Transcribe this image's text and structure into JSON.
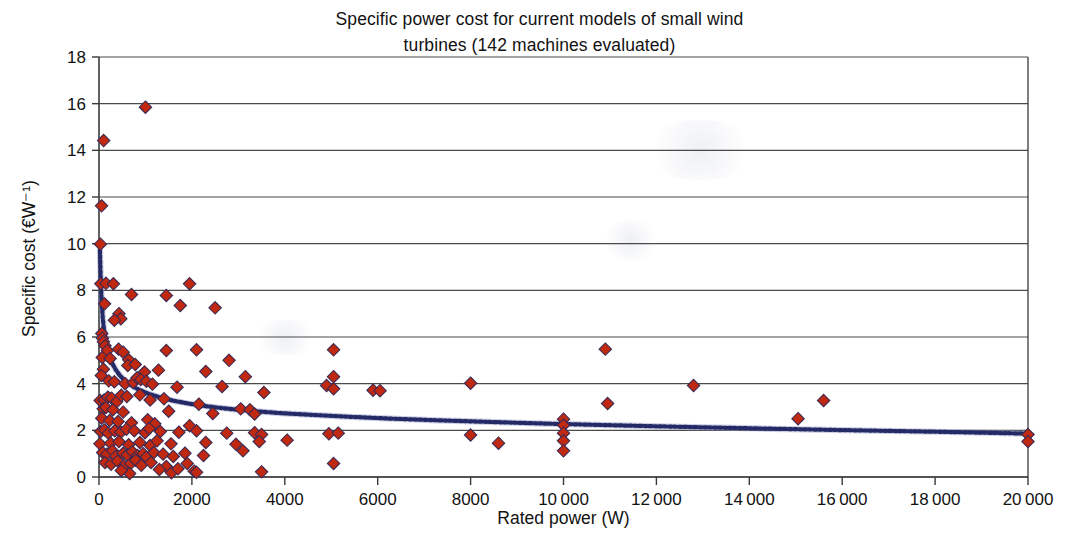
{
  "chart_data": {
    "type": "scatter",
    "title": "Specific power cost for current models of small wind\nturbines (142 machines evaluated)",
    "xlabel": "Rated power (W)",
    "ylabel": "Specific cost (€W⁻¹)",
    "xlim": [
      0,
      20000
    ],
    "ylim": [
      0,
      18
    ],
    "xticks": [
      0,
      2000,
      4000,
      6000,
      8000,
      10000,
      12000,
      14000,
      16000,
      18000,
      20000
    ],
    "xtick_labels": [
      "0",
      "2000",
      "4000",
      "6000",
      "8000",
      "10 000",
      "12 000",
      "14 000",
      "16 000",
      "18 000",
      "20 000"
    ],
    "yticks": [
      0,
      2,
      4,
      6,
      8,
      10,
      12,
      14,
      16,
      18
    ],
    "ytick_labels": [
      "0",
      "2",
      "4",
      "6",
      "8",
      "10",
      "12",
      "14",
      "16",
      "18"
    ],
    "grid": "horizontal",
    "legend": "none",
    "n_machines": 142,
    "marker_color": "#c0280f",
    "marker_edge_color": "#3c2a55",
    "marker_shape": "diamond",
    "trendline": {
      "style": "dotted",
      "color": "#232a66",
      "description": "power-law fit decaying from ~9.7 at low rated power to ~1.8 at 20000 W",
      "points": [
        [
          20,
          9.7
        ],
        [
          40,
          8.3
        ],
        [
          60,
          7.4
        ],
        [
          80,
          6.85
        ],
        [
          100,
          6.45
        ],
        [
          140,
          5.9
        ],
        [
          180,
          5.5
        ],
        [
          230,
          5.15
        ],
        [
          290,
          4.85
        ],
        [
          360,
          4.6
        ],
        [
          450,
          4.35
        ],
        [
          560,
          4.12
        ],
        [
          700,
          3.92
        ],
        [
          860,
          3.74
        ],
        [
          1050,
          3.58
        ],
        [
          1300,
          3.42
        ],
        [
          1600,
          3.27
        ],
        [
          1950,
          3.14
        ],
        [
          2350,
          3.02
        ],
        [
          2800,
          2.92
        ],
        [
          3300,
          2.83
        ],
        [
          3900,
          2.74
        ],
        [
          4600,
          2.66
        ],
        [
          5400,
          2.58
        ],
        [
          6300,
          2.5
        ],
        [
          7300,
          2.43
        ],
        [
          8400,
          2.36
        ],
        [
          9600,
          2.29
        ],
        [
          11000,
          2.22
        ],
        [
          12500,
          2.15
        ],
        [
          14200,
          2.08
        ],
        [
          16000,
          2.01
        ],
        [
          18000,
          1.94
        ],
        [
          20000,
          1.86
        ]
      ]
    },
    "points": [
      [
        30,
        9.98
      ],
      [
        55,
        11.62
      ],
      [
        100,
        14.42
      ],
      [
        1000,
        15.85
      ],
      [
        40,
        8.28
      ],
      [
        150,
        8.3
      ],
      [
        310,
        8.28
      ],
      [
        1950,
        8.28
      ],
      [
        120,
        7.42
      ],
      [
        700,
        7.82
      ],
      [
        1450,
        7.78
      ],
      [
        1750,
        7.35
      ],
      [
        2500,
        7.25
      ],
      [
        430,
        7.0
      ],
      [
        470,
        6.78
      ],
      [
        330,
        6.72
      ],
      [
        60,
        6.15
      ],
      [
        75,
        5.95
      ],
      [
        95,
        5.8
      ],
      [
        130,
        5.62
      ],
      [
        180,
        5.42
      ],
      [
        420,
        5.48
      ],
      [
        520,
        5.35
      ],
      [
        1450,
        5.42
      ],
      [
        2100,
        5.45
      ],
      [
        5050,
        5.45
      ],
      [
        10900,
        5.48
      ],
      [
        70,
        5.12
      ],
      [
        240,
        5.08
      ],
      [
        640,
        5.02
      ],
      [
        2800,
        5.0
      ],
      [
        95,
        4.62
      ],
      [
        620,
        4.78
      ],
      [
        780,
        4.82
      ],
      [
        980,
        4.5
      ],
      [
        1280,
        4.58
      ],
      [
        2300,
        4.52
      ],
      [
        3150,
        4.3
      ],
      [
        5050,
        4.3
      ],
      [
        50,
        4.35
      ],
      [
        210,
        4.12
      ],
      [
        330,
        4.08
      ],
      [
        560,
        4.0
      ],
      [
        740,
        4.05
      ],
      [
        820,
        4.25
      ],
      [
        900,
        4.18
      ],
      [
        1020,
        4.1
      ],
      [
        1150,
        3.98
      ],
      [
        1680,
        3.85
      ],
      [
        2650,
        3.88
      ],
      [
        3550,
        3.62
      ],
      [
        4900,
        3.92
      ],
      [
        5050,
        3.78
      ],
      [
        5900,
        3.72
      ],
      [
        6050,
        3.7
      ],
      [
        8000,
        4.02
      ],
      [
        12800,
        3.92
      ],
      [
        25,
        3.28
      ],
      [
        110,
        3.3
      ],
      [
        190,
        3.42
      ],
      [
        270,
        3.38
      ],
      [
        380,
        3.22
      ],
      [
        480,
        3.5
      ],
      [
        600,
        3.45
      ],
      [
        880,
        3.52
      ],
      [
        1100,
        3.3
      ],
      [
        1400,
        3.35
      ],
      [
        2150,
        3.12
      ],
      [
        3050,
        2.92
      ],
      [
        3250,
        2.88
      ],
      [
        10950,
        3.15
      ],
      [
        15600,
        3.28
      ],
      [
        90,
        2.92
      ],
      [
        150,
        2.98
      ],
      [
        300,
        2.88
      ],
      [
        520,
        2.78
      ],
      [
        1500,
        2.82
      ],
      [
        2450,
        2.72
      ],
      [
        3350,
        2.7
      ],
      [
        10000,
        2.48
      ],
      [
        15050,
        2.5
      ],
      [
        60,
        2.52
      ],
      [
        230,
        2.42
      ],
      [
        410,
        2.38
      ],
      [
        700,
        2.32
      ],
      [
        1050,
        2.45
      ],
      [
        1200,
        2.28
      ],
      [
        1950,
        2.2
      ],
      [
        10000,
        2.22
      ],
      [
        35,
        1.95
      ],
      [
        120,
        2.02
      ],
      [
        200,
        1.88
      ],
      [
        340,
        1.98
      ],
      [
        470,
        1.92
      ],
      [
        590,
        2.05
      ],
      [
        760,
        1.98
      ],
      [
        990,
        1.9
      ],
      [
        1080,
        2.08
      ],
      [
        1320,
        1.95
      ],
      [
        1720,
        1.92
      ],
      [
        2100,
        1.98
      ],
      [
        2750,
        1.88
      ],
      [
        3350,
        1.9
      ],
      [
        3500,
        1.82
      ],
      [
        4950,
        1.85
      ],
      [
        5150,
        1.88
      ],
      [
        8000,
        1.8
      ],
      [
        10000,
        1.88
      ],
      [
        20000,
        1.82
      ],
      [
        20,
        1.42
      ],
      [
        250,
        1.45
      ],
      [
        430,
        1.52
      ],
      [
        640,
        1.38
      ],
      [
        880,
        1.48
      ],
      [
        1100,
        1.35
      ],
      [
        1250,
        1.55
      ],
      [
        1550,
        1.42
      ],
      [
        2300,
        1.48
      ],
      [
        2950,
        1.4
      ],
      [
        3100,
        1.12
      ],
      [
        3450,
        1.52
      ],
      [
        4050,
        1.58
      ],
      [
        8600,
        1.45
      ],
      [
        10000,
        1.55
      ],
      [
        20000,
        1.52
      ],
      [
        80,
        1.05
      ],
      [
        170,
        0.98
      ],
      [
        290,
        1.12
      ],
      [
        360,
        0.88
      ],
      [
        520,
        1.02
      ],
      [
        610,
        0.95
      ],
      [
        720,
        1.08
      ],
      [
        830,
        0.92
      ],
      [
        950,
        1.0
      ],
      [
        1020,
        0.85
      ],
      [
        1180,
        1.05
      ],
      [
        1380,
        0.98
      ],
      [
        1600,
        0.88
      ],
      [
        1850,
        1.02
      ],
      [
        2250,
        0.92
      ],
      [
        10000,
        1.12
      ],
      [
        130,
        0.62
      ],
      [
        260,
        0.55
      ],
      [
        400,
        0.68
      ],
      [
        540,
        0.48
      ],
      [
        680,
        0.58
      ],
      [
        790,
        0.72
      ],
      [
        910,
        0.5
      ],
      [
        1120,
        0.62
      ],
      [
        1450,
        0.45
      ],
      [
        1900,
        0.58
      ],
      [
        2050,
        0.25
      ],
      [
        2100,
        0.2
      ],
      [
        3500,
        0.22
      ],
      [
        5050,
        0.58
      ],
      [
        1560,
        0.18
      ],
      [
        660,
        0.15
      ],
      [
        480,
        0.28
      ],
      [
        1300,
        0.32
      ],
      [
        1700,
        0.35
      ]
    ]
  }
}
